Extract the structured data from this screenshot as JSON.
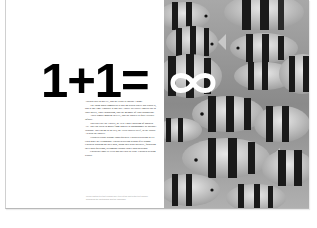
{
  "spread": {
    "headline": "1+1=",
    "infinity_symbol": "∞",
    "body_paragraphs": [
      "Add our dial to our PC, and the result is instant 1 game.",
      "The thing about computers is that go search where our world is, and at any time. Possibly at one day. You're in exactly limited just to your ability, your enthusiasm, and the memory of your disposition.",
      "Add a simple modem to a PC, and the answer is quite literally infinite.",
      "You can visit the Louvre, or New York's Museum of Modern Art. You can listen to music from Mozart to Moondoggie or Michael Jackson. You can go to the sea, the Great Barrier Reef, to the library - search the answer.",
      "Teachers report strange consequences. Children starting to tell each other the technology. Children staying behind after school. Children working on their own, using their own initiative, following their own questions, becoming curious rather than incurious.",
      "Children's logic is vivid and speeded to learn. Children seeking results."
    ],
    "caption": "Lorem caption text set in small grey type at the foot of the text column, describing the photograph and the campaign."
  },
  "colors": {
    "page": "#ffffff",
    "headline": "#000000",
    "photo_tone": "#8f8f8f",
    "infinity": "#ffffff"
  }
}
